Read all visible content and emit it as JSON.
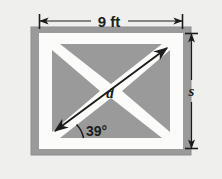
{
  "figure": {
    "labels": {
      "width_dimension": "9 ft",
      "height_dimension": "s",
      "diagonal": "d",
      "angle": "39°"
    },
    "colors": {
      "page_background": "#efefee",
      "panel_gray": "#9a9a9a",
      "frame_white": "#fbfbfa",
      "ink": "#1c1c1c",
      "panel_border": "#8a8a8a"
    },
    "geometry": {
      "panel": {
        "x": 31,
        "y": 27,
        "width": 160,
        "height": 128
      },
      "frame_outer": {
        "x": 39,
        "y": 33,
        "width": 144,
        "height": 116
      },
      "inner_field": {
        "x": 52,
        "y": 44,
        "width": 118,
        "height": 94
      },
      "band_half_width": 7,
      "diagonal_start": {
        "x": 55,
        "y": 131
      },
      "diagonal_end": {
        "x": 167,
        "y": 48
      },
      "angle_degrees": 39
    },
    "annotations": {
      "width_line": {
        "y": 21,
        "x1": 39,
        "x2": 183
      },
      "height_line": {
        "x": 191,
        "y1": 33,
        "y2": 149
      }
    }
  }
}
